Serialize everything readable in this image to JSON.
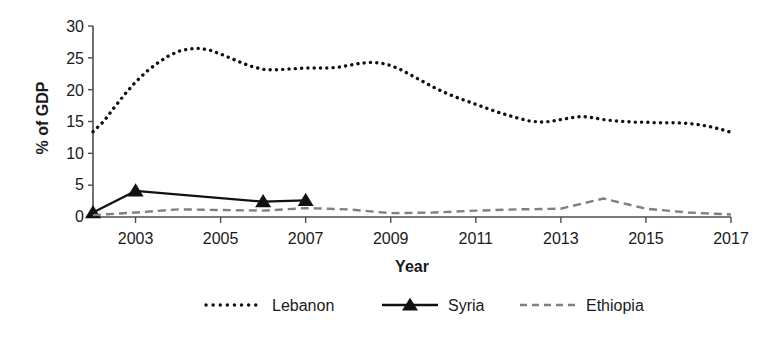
{
  "chart_data": {
    "type": "line",
    "title": "",
    "xlabel": "Year",
    "ylabel": "% of GDP",
    "xlim": [
      2002,
      2017
    ],
    "ylim": [
      0,
      30
    ],
    "yticks": [
      0,
      5,
      10,
      15,
      20,
      25,
      30
    ],
    "xticks": [
      2003,
      2005,
      2007,
      2009,
      2011,
      2013,
      2015,
      2017
    ],
    "xtick_labels": [
      "2003",
      "2005",
      "2007",
      "2009",
      "2011",
      "2013",
      "2015",
      "2017"
    ],
    "ytick_labels": [
      "0",
      "5",
      "10",
      "15",
      "20",
      "25",
      "30"
    ],
    "grid": false,
    "legend_position": "bottom",
    "series": [
      {
        "name": "Lebanon",
        "style": "dotted",
        "color": "#111111",
        "marker": "none",
        "x": [
          2002,
          2002.25,
          2002.5,
          2002.75,
          2003,
          2003.25,
          2003.5,
          2003.75,
          2004,
          2004.25,
          2004.5,
          2004.75,
          2005,
          2005.25,
          2005.5,
          2005.75,
          2006,
          2006.25,
          2006.5,
          2006.75,
          2007,
          2007.25,
          2007.5,
          2007.75,
          2008,
          2008.25,
          2008.5,
          2008.75,
          2009,
          2009.25,
          2009.5,
          2009.75,
          2010,
          2010.25,
          2010.5,
          2010.75,
          2011,
          2011.25,
          2011.5,
          2011.75,
          2012,
          2012.25,
          2012.5,
          2012.75,
          2013,
          2013.25,
          2013.5,
          2013.75,
          2014,
          2014.25,
          2014.5,
          2014.75,
          2015,
          2015.25,
          2015.5,
          2015.75,
          2016,
          2016.25,
          2016.5,
          2016.75,
          2017
        ],
        "values": [
          13.4,
          15.0,
          17.2,
          19.3,
          21.2,
          22.8,
          24.1,
          25.2,
          26.0,
          26.4,
          26.5,
          26.2,
          25.6,
          24.9,
          24.2,
          23.6,
          23.2,
          23.1,
          23.2,
          23.3,
          23.4,
          23.4,
          23.4,
          23.5,
          23.8,
          24.1,
          24.3,
          24.2,
          23.8,
          23.1,
          22.2,
          21.3,
          20.4,
          19.6,
          18.9,
          18.3,
          17.7,
          17.1,
          16.5,
          16.0,
          15.5,
          15.1,
          14.9,
          15.0,
          15.3,
          15.6,
          15.8,
          15.6,
          15.3,
          15.1,
          15.0,
          14.9,
          14.9,
          14.8,
          14.8,
          14.8,
          14.7,
          14.5,
          14.2,
          13.8,
          13.3
        ]
      },
      {
        "name": "Syria",
        "style": "solid",
        "color": "#111111",
        "marker": "triangle",
        "x": [
          2002,
          2003,
          2006,
          2007
        ],
        "values": [
          0.7,
          4.1,
          2.4,
          2.6
        ]
      },
      {
        "name": "Ethiopia",
        "style": "dashed",
        "color": "#808080",
        "marker": "none",
        "x": [
          2002,
          2003,
          2004,
          2005,
          2006,
          2007,
          2008,
          2009,
          2010,
          2011,
          2012,
          2013,
          2014,
          2015,
          2016,
          2017
        ],
        "values": [
          0.3,
          0.7,
          1.2,
          1.1,
          1.0,
          1.4,
          1.2,
          0.6,
          0.7,
          1.0,
          1.2,
          1.3,
          2.9,
          1.3,
          0.7,
          0.4
        ]
      }
    ]
  },
  "legend": {
    "items": [
      {
        "label": "Lebanon",
        "swatch": "dotted-line-swatch"
      },
      {
        "label": "Syria",
        "swatch": "solid-triangle-line-swatch"
      },
      {
        "label": "Ethiopia",
        "swatch": "dashed-line-swatch"
      }
    ]
  }
}
